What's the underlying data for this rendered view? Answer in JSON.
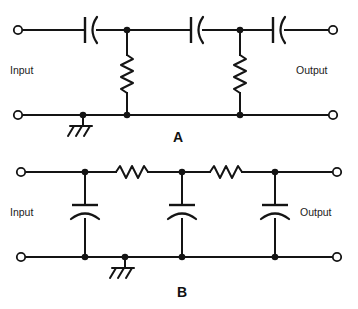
{
  "figure": {
    "background_color": "#ffffff",
    "line_color": "#141414",
    "width": 358,
    "height": 309
  },
  "circuits": [
    {
      "id": "A",
      "label": "A",
      "label_x": 178,
      "label_y": 142,
      "topology": "high-pass ladder: three series capacitors with two shunt resistors",
      "input_label": "Input",
      "input_label_x": 10,
      "input_label_y": 74,
      "output_label": "Output",
      "output_label_x": 296,
      "output_label_y": 74,
      "top_rail_y": 30,
      "bottom_rail_y": 115,
      "left_terminal_x": 18,
      "right_terminal_x": 333,
      "series_components": [
        {
          "name": "capacitor-a1",
          "type": "capacitor",
          "orientation": "horizontal",
          "center_x": 90,
          "center_y": 30
        },
        {
          "name": "capacitor-a2",
          "type": "capacitor",
          "orientation": "horizontal",
          "center_x": 196,
          "center_y": 30
        },
        {
          "name": "capacitor-a3",
          "type": "capacitor",
          "orientation": "horizontal",
          "center_x": 278,
          "center_y": 30
        }
      ],
      "shunt_components": [
        {
          "name": "resistor-a1",
          "type": "resistor",
          "orientation": "vertical",
          "x": 127,
          "center_y": 72
        },
        {
          "name": "resistor-a2",
          "type": "resistor",
          "orientation": "vertical",
          "x": 240,
          "center_y": 72
        }
      ],
      "nodes": [
        {
          "name": "node-a-top-1",
          "x": 127,
          "y": 30
        },
        {
          "name": "node-a-top-2",
          "x": 240,
          "y": 30
        },
        {
          "name": "node-a-bottom-1",
          "x": 127,
          "y": 115
        },
        {
          "name": "node-a-bottom-2",
          "x": 240,
          "y": 115
        },
        {
          "name": "node-a-ground",
          "x": 83,
          "y": 115
        }
      ],
      "ground": {
        "name": "ground-symbol-a",
        "x": 83,
        "y": 115,
        "type": "chassis-ground"
      }
    },
    {
      "id": "B",
      "label": "B",
      "label_x": 182,
      "label_y": 297,
      "topology": "low-pass ladder: two series resistors with three shunt capacitors",
      "input_label": "Input",
      "input_label_x": 10,
      "input_label_y": 216,
      "output_label": "Output",
      "output_label_x": 300,
      "output_label_y": 216,
      "top_rail_y": 172,
      "bottom_rail_y": 257,
      "left_terminal_x": 21,
      "right_terminal_x": 337,
      "series_components": [
        {
          "name": "resistor-b1",
          "type": "resistor",
          "orientation": "horizontal",
          "center_x": 134,
          "center_y": 172
        },
        {
          "name": "resistor-b2",
          "type": "resistor",
          "orientation": "horizontal",
          "center_x": 228,
          "center_y": 172
        }
      ],
      "shunt_components": [
        {
          "name": "capacitor-b1",
          "type": "capacitor",
          "orientation": "vertical",
          "x": 85,
          "center_y": 212
        },
        {
          "name": "capacitor-b2",
          "type": "capacitor",
          "orientation": "vertical",
          "x": 182,
          "center_y": 212
        },
        {
          "name": "capacitor-b3",
          "type": "capacitor",
          "orientation": "vertical",
          "x": 275,
          "center_y": 212
        }
      ],
      "nodes": [
        {
          "name": "node-b-top-1",
          "x": 85,
          "y": 172
        },
        {
          "name": "node-b-top-2",
          "x": 182,
          "y": 172
        },
        {
          "name": "node-b-top-3",
          "x": 275,
          "y": 172
        },
        {
          "name": "node-b-bottom-1",
          "x": 85,
          "y": 257
        },
        {
          "name": "node-b-bottom-2",
          "x": 182,
          "y": 257
        },
        {
          "name": "node-b-bottom-3",
          "x": 275,
          "y": 257
        },
        {
          "name": "node-b-ground",
          "x": 125,
          "y": 257
        }
      ],
      "ground": {
        "name": "ground-symbol-b",
        "x": 125,
        "y": 257,
        "type": "chassis-ground"
      }
    }
  ]
}
